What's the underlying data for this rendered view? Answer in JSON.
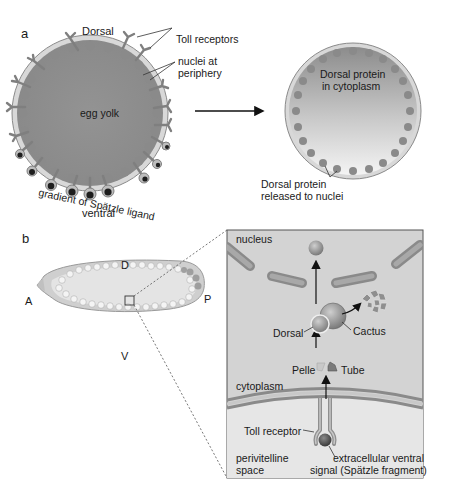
{
  "panel_a": {
    "letter": "a",
    "left_egg": {
      "top_label": "Dorsal",
      "bottom_label": "ventral",
      "center_label": "egg yolk",
      "callouts": [
        "Toll receptors",
        "nuclei at",
        "periphery"
      ],
      "gradient_label": "gradient of Spätzle ligand"
    },
    "right_egg": {
      "center_label_line1": "Dorsal protein",
      "center_label_line2": "in cytoplasm",
      "bottom_label_line1": "Dorsal protein",
      "bottom_label_line2": "released to nuclei"
    }
  },
  "panel_b": {
    "letter": "b",
    "embryo": {
      "axis_labels": {
        "dorsal": "D",
        "ventral": "V",
        "anterior": "A",
        "posterior": "P"
      }
    },
    "detail": {
      "nucleus_label": "nucleus",
      "dorsal_label": "Dorsal",
      "cactus_label": "Cactus",
      "pelle_label": "Pelle",
      "tube_label": "Tube",
      "cytoplasm_label": "cytoplasm",
      "toll_label": "Toll receptor",
      "perivitelline_line1": "perivitelline",
      "perivitelline_line2": "space",
      "signal_line1": "extracellular ventral",
      "signal_line2": "signal (Spätzle fragment)"
    }
  },
  "colors": {
    "yolk": "#8f8f8f",
    "membrane": "#d9d9d9",
    "nuclei": "#7d7d7d",
    "ligand": "#2a2a2a",
    "panel_bg": "#d4d4d4",
    "perivitelline_bg": "#e6e6e6"
  }
}
